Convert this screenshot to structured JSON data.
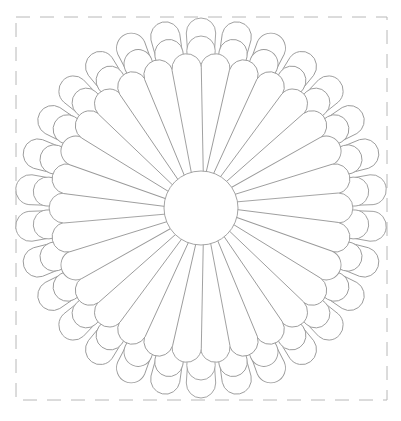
{
  "drawing": {
    "subject": "flower-coloring-page",
    "stroke_color": "#9a9a9a",
    "frame_color": "#b8b8b8",
    "background": "#ffffff",
    "frame": {
      "x": 16,
      "y": 17,
      "width": 371,
      "height": 383
    },
    "center": {
      "cx": 201,
      "cy": 208,
      "r": 37
    },
    "petal_count_per_layer": 30,
    "layers": [
      {
        "name": "outer",
        "length": 190,
        "tip_width": 30,
        "angle_offset": 0
      },
      {
        "name": "middle",
        "length": 172,
        "tip_width": 29,
        "angle_offset": 0
      },
      {
        "name": "front",
        "length": 155,
        "tip_width": 30,
        "angle_offset": 6
      }
    ]
  }
}
